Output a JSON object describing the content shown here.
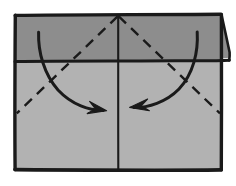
{
  "diagram": {
    "canvas": {
      "width": 236,
      "height": 186,
      "background": "#ffffff"
    },
    "colors": {
      "paper_front": "#b2b2b2",
      "paper_back_band": "#8d8d8d",
      "ink": "#1a1a1a",
      "background": "#ffffff"
    },
    "sheet": {
      "label": "paper sheet",
      "x": 14,
      "y": 14,
      "width": 208,
      "height": 157,
      "stroke_width": 3.2
    },
    "top_band": {
      "label": "folded top band",
      "y_bottom": 61,
      "overhang_right": 8,
      "note": "darker reverse side of paper, folded down"
    },
    "creases": [
      {
        "name": "center-vertical-crease",
        "type": "solid",
        "from": [
          118,
          14
        ],
        "to": [
          118,
          170
        ],
        "label": "vertical center crease"
      },
      {
        "name": "left-diagonal-crease",
        "type": "dashed",
        "from": [
          118,
          16
        ],
        "to": [
          17,
          113
        ],
        "label": "left valley fold line"
      },
      {
        "name": "right-diagonal-crease",
        "type": "dashed",
        "from": [
          118,
          16
        ],
        "to": [
          220,
          113
        ],
        "label": "right valley fold line"
      }
    ],
    "arrows": [
      {
        "name": "left-fold-arrow",
        "label": "fold left corner in toward center",
        "direction": "right",
        "start": [
          39,
          32
        ],
        "end": [
          106,
          110
        ]
      },
      {
        "name": "right-fold-arrow",
        "label": "fold right corner in toward center",
        "direction": "left",
        "start": [
          197,
          32
        ],
        "end": [
          130,
          107
        ]
      }
    ]
  }
}
